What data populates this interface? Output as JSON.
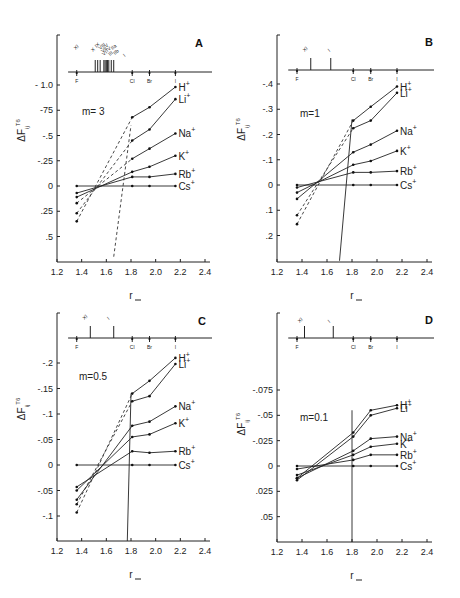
{
  "chart_data": [
    {
      "panel": "A",
      "type": "line",
      "title": "m= 3",
      "xlabel": "r_",
      "ylabel": "ΔF_ij^T6",
      "xlim": [
        1.2,
        2.4
      ],
      "xticks": [
        "1.2",
        "1.4",
        "1.6",
        "1.8",
        "2.0",
        "2.2",
        "2.4"
      ],
      "yticks": [
        "- 1.0",
        "-75",
        "-.5",
        "-.25",
        "0",
        ".25",
        ".5"
      ],
      "ytick_values": [
        -1.0,
        -0.75,
        -0.5,
        -0.25,
        0,
        0.25,
        0.5
      ],
      "ylim": [
        0.7,
        -1.15
      ],
      "halide_markers": [
        "F",
        "Cl",
        "Br",
        "I"
      ],
      "halide_positions": [
        1.36,
        1.81,
        1.95,
        2.16
      ],
      "top_marker_labels": [
        "XI",
        "X",
        "IX",
        "VIII",
        "VII",
        "VI",
        "V",
        "IV",
        "III",
        "IIa",
        "IIb",
        "I"
      ],
      "series": [
        {
          "name": "H+",
          "x": [
            1.36,
            1.81,
            1.95,
            2.16
          ],
          "y": [
            0.35,
            -0.68,
            -0.78,
            -0.98
          ]
        },
        {
          "name": "Li+",
          "x": [
            1.36,
            1.81,
            1.95,
            2.16
          ],
          "y": [
            0.27,
            -0.45,
            -0.56,
            -0.86
          ]
        },
        {
          "name": "Na+",
          "x": [
            1.36,
            1.81,
            1.95,
            2.16
          ],
          "y": [
            0.17,
            -0.27,
            -0.37,
            -0.52
          ]
        },
        {
          "name": "K+",
          "x": [
            1.36,
            1.81,
            1.95,
            2.16
          ],
          "y": [
            0.11,
            -0.14,
            -0.19,
            -0.3
          ]
        },
        {
          "name": "Rb+",
          "x": [
            1.36,
            1.81,
            1.95,
            2.16
          ],
          "y": [
            0.07,
            -0.09,
            -0.09,
            -0.12
          ]
        },
        {
          "name": "Cs+",
          "x": [
            1.36,
            1.81,
            1.95,
            2.16
          ],
          "y": [
            0,
            0,
            0,
            0
          ]
        }
      ],
      "vertical_line": {
        "style": "dashed",
        "x": [
          1.66,
          1.8
        ],
        "y": [
          0.7,
          -0.6
        ]
      }
    },
    {
      "panel": "B",
      "type": "line",
      "title": "m=1",
      "xlabel": "r_",
      "ylabel": "ΔF_ij^T6",
      "xlim": [
        1.2,
        2.4
      ],
      "xticks": [
        "1.2",
        "1.4",
        "1.6",
        "1.8",
        "2.0",
        "2.2",
        "2.4"
      ],
      "yticks": [
        "-.4",
        "-.3",
        "-.2",
        "-.1",
        "0",
        ".1",
        ".2"
      ],
      "ytick_values": [
        -0.4,
        -0.3,
        -0.2,
        -0.1,
        0,
        0.1,
        0.2
      ],
      "ylim": [
        0.3,
        -0.55
      ],
      "halide_markers": [
        "F",
        "Cl",
        "Br",
        "I"
      ],
      "halide_positions": [
        1.36,
        1.81,
        1.95,
        2.16
      ],
      "top_marker_labels": [
        "XI",
        "I"
      ],
      "series": [
        {
          "name": "H+",
          "x": [
            1.36,
            1.81,
            1.95,
            2.16
          ],
          "y": [
            0.155,
            -0.255,
            -0.31,
            -0.39
          ]
        },
        {
          "name": "Li+",
          "x": [
            1.36,
            1.81,
            1.95,
            2.16
          ],
          "y": [
            0.12,
            -0.225,
            -0.255,
            -0.365
          ]
        },
        {
          "name": "Na+",
          "x": [
            1.36,
            1.81,
            1.95,
            2.16
          ],
          "y": [
            0.055,
            -0.13,
            -0.16,
            -0.215
          ]
        },
        {
          "name": "K+",
          "x": [
            1.36,
            1.81,
            1.95,
            2.16
          ],
          "y": [
            0.03,
            -0.08,
            -0.095,
            -0.135
          ]
        },
        {
          "name": "Rb+",
          "x": [
            1.36,
            1.81,
            1.95,
            2.16
          ],
          "y": [
            0.01,
            -0.05,
            -0.05,
            -0.055
          ]
        },
        {
          "name": "Cs+",
          "x": [
            1.36,
            1.81,
            1.95,
            2.16
          ],
          "y": [
            0,
            0,
            0,
            0
          ]
        }
      ],
      "vertical_line": {
        "style": "solid",
        "x": [
          1.7,
          1.8
        ],
        "y": [
          0.3,
          -0.26
        ]
      }
    },
    {
      "panel": "C",
      "type": "line",
      "title": "m=0.5",
      "xlabel": "r_",
      "ylabel": "ΔF_ij^T6",
      "xlim": [
        1.2,
        2.4
      ],
      "xticks": [
        "1.2",
        "1.4",
        "1.6",
        "1.8",
        "2.0",
        "2.2",
        "2.4"
      ],
      "yticks": [
        "-.2",
        "-.15",
        "-.1",
        "-.05",
        "0",
        "-.05",
        "-.1"
      ],
      "ytick_values": [
        -0.2,
        -0.15,
        -0.1,
        -0.05,
        0,
        0.05,
        0.1
      ],
      "ylim": [
        0.15,
        -0.275
      ],
      "halide_markers": [
        "F",
        "Cl",
        "Br",
        "I"
      ],
      "halide_positions": [
        1.36,
        1.81,
        1.95,
        2.16
      ],
      "top_marker_labels": [
        "XI",
        "I"
      ],
      "series": [
        {
          "name": "H+",
          "x": [
            1.36,
            1.81,
            1.95,
            2.16
          ],
          "y": [
            0.093,
            -0.14,
            -0.165,
            -0.21
          ]
        },
        {
          "name": "Li+",
          "x": [
            1.36,
            1.81,
            1.95,
            2.16
          ],
          "y": [
            0.077,
            -0.125,
            -0.135,
            -0.198
          ]
        },
        {
          "name": "Na+",
          "x": [
            1.36,
            1.81,
            1.95,
            2.16
          ],
          "y": [
            0.068,
            -0.077,
            -0.085,
            -0.115
          ]
        },
        {
          "name": "K+",
          "x": [
            1.36,
            1.81,
            1.95,
            2.16
          ],
          "y": [
            0.05,
            -0.055,
            -0.06,
            -0.082
          ]
        },
        {
          "name": "Rb+",
          "x": [
            1.36,
            1.81,
            1.95,
            2.16
          ],
          "y": [
            0.043,
            -0.027,
            -0.024,
            -0.027
          ]
        },
        {
          "name": "Cs+",
          "x": [
            1.36,
            1.81,
            1.95,
            2.16
          ],
          "y": [
            0,
            0,
            0,
            0
          ]
        }
      ],
      "vertical_line": {
        "style": "solid",
        "x": [
          1.77,
          1.8
        ],
        "y": [
          0.15,
          -0.14
        ]
      }
    },
    {
      "panel": "D",
      "type": "line",
      "title": "m=0.1",
      "xlabel": "r_",
      "ylabel": "ΔF_ij^T6",
      "xlim": [
        1.2,
        2.4
      ],
      "xticks": [
        "1.2",
        "1.4",
        "1.6",
        "1.8",
        "2.0",
        "2.2",
        "2.4"
      ],
      "yticks": [
        "-.075",
        "-.05",
        "-.025",
        "0",
        ".025",
        ".05"
      ],
      "ytick_values": [
        -0.075,
        -0.05,
        -0.025,
        0,
        0.025,
        0.05
      ],
      "ylim": [
        0.075,
        -0.14
      ],
      "halide_markers": [
        "F",
        "Cl",
        "Br",
        "I"
      ],
      "halide_positions": [
        1.36,
        1.81,
        1.95,
        2.16
      ],
      "top_marker_labels": [
        "XI",
        "I"
      ],
      "series": [
        {
          "name": "H+",
          "x": [
            1.36,
            1.81,
            1.95,
            2.16
          ],
          "y": [
            0.012,
            -0.033,
            -0.055,
            -0.06
          ]
        },
        {
          "name": "Li+",
          "x": [
            1.36,
            1.81,
            1.95,
            2.16
          ],
          "y": [
            0.014,
            -0.029,
            -0.05,
            -0.057
          ]
        },
        {
          "name": "Na+",
          "x": [
            1.36,
            1.81,
            1.95,
            2.16
          ],
          "y": [
            0.012,
            -0.015,
            -0.027,
            -0.029
          ]
        },
        {
          "name": "K+",
          "x": [
            1.36,
            1.81,
            1.95,
            2.16
          ],
          "y": [
            0.009,
            -0.011,
            -0.019,
            -0.022
          ]
        },
        {
          "name": "Rb+",
          "x": [
            1.36,
            1.81,
            1.95,
            2.16
          ],
          "y": [
            0.003,
            -0.006,
            -0.011,
            -0.011
          ]
        },
        {
          "name": "Cs+",
          "x": [
            1.36,
            1.81,
            1.95,
            2.16
          ],
          "y": [
            0,
            0,
            0,
            0
          ]
        }
      ],
      "vertical_line": {
        "style": "solid",
        "x": [
          1.8,
          1.8
        ],
        "y": [
          0.075,
          -0.055
        ]
      }
    }
  ],
  "panels": [
    {
      "letter": "A",
      "m_label": "m= 3",
      "xlabel": "r_",
      "ylabel": "ΔF",
      "ylabel_sup": "T6",
      "ylabel_sub": "ij"
    },
    {
      "letter": "B",
      "m_label": "m=1",
      "xlabel": "r_",
      "ylabel": "ΔF",
      "ylabel_sup": "T6",
      "ylabel_sub": "ij"
    },
    {
      "letter": "C",
      "m_label": "m=0.5",
      "xlabel": "r_",
      "ylabel": "ΔF",
      "ylabel_sup": "T6",
      "ylabel_sub": "ij"
    },
    {
      "letter": "D",
      "m_label": "m=0.1",
      "xlabel": "r_",
      "ylabel": "ΔF",
      "ylabel_sup": "T6",
      "ylabel_sub": "ij"
    }
  ],
  "ion_labels": [
    "H⁺",
    "Li⁺",
    "Na⁺",
    "K⁺",
    "Rb⁺",
    "Cs⁺"
  ],
  "halides": [
    "F",
    "Cl",
    "Br",
    "I"
  ]
}
